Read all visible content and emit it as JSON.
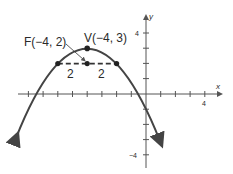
{
  "diagram": {
    "type": "parabola-graph",
    "colors": {
      "curve": "#444444",
      "axis": "#555555",
      "text": "#2a2a2a",
      "background": "#ffffff"
    },
    "axes": {
      "x_label": "x",
      "y_label": "y",
      "x_tick_label": "4",
      "y_tick_label_top": "4",
      "y_tick_label_bottom": "−4",
      "x_range": [
        -9,
        4
      ],
      "y_range": [
        -4,
        4
      ]
    },
    "parabola": {
      "equation": "(x + 4)^2 = -4(y - 3)",
      "opens": "down"
    },
    "points": {
      "vertex_label": "V(−4, 3)",
      "focus_label": "F(−4, 2)"
    },
    "latus_rectum": {
      "left_half_label": "2",
      "right_half_label": "2"
    }
  }
}
